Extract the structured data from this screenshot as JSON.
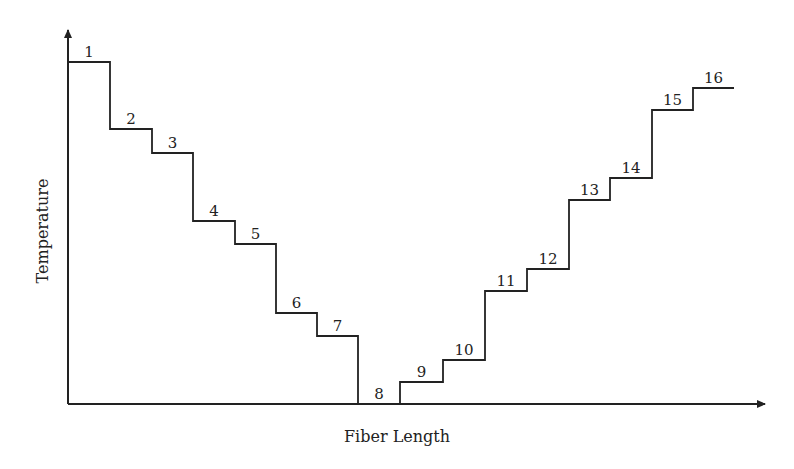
{
  "chart_data": {
    "type": "line",
    "style": "step",
    "title": "",
    "xlabel": "Fiber Length",
    "ylabel": "Temperature",
    "grid": false,
    "legend": null,
    "axis_ticks": false,
    "units_note": "Relative levels (no numeric ticks shown); values in arbitrary units, baseline = 0",
    "segments": [
      {
        "label": "1",
        "x_start": 0,
        "x_end": 42,
        "value": 342
      },
      {
        "label": "2",
        "x_start": 42,
        "x_end": 84,
        "value": 275
      },
      {
        "label": "3",
        "x_start": 84,
        "x_end": 125,
        "value": 251
      },
      {
        "label": "4",
        "x_start": 125,
        "x_end": 167,
        "value": 183
      },
      {
        "label": "5",
        "x_start": 167,
        "x_end": 208,
        "value": 160
      },
      {
        "label": "6",
        "x_start": 208,
        "x_end": 249,
        "value": 91
      },
      {
        "label": "7",
        "x_start": 249,
        "x_end": 290,
        "value": 68
      },
      {
        "label": "8",
        "x_start": 290,
        "x_end": 332,
        "value": 0
      },
      {
        "label": "9",
        "x_start": 332,
        "x_end": 375,
        "value": 22
      },
      {
        "label": "10",
        "x_start": 375,
        "x_end": 417,
        "value": 44
      },
      {
        "label": "11",
        "x_start": 417,
        "x_end": 459,
        "value": 113
      },
      {
        "label": "12",
        "x_start": 459,
        "x_end": 501,
        "value": 135
      },
      {
        "label": "13",
        "x_start": 501,
        "x_end": 542,
        "value": 204
      },
      {
        "label": "14",
        "x_start": 542,
        "x_end": 584,
        "value": 226
      },
      {
        "label": "15",
        "x_start": 584,
        "x_end": 625,
        "value": 294
      },
      {
        "label": "16",
        "x_start": 625,
        "x_end": 666,
        "value": 316
      }
    ],
    "categories": [
      "1",
      "2",
      "3",
      "4",
      "5",
      "6",
      "7",
      "8",
      "9",
      "10",
      "11",
      "12",
      "13",
      "14",
      "15",
      "16"
    ],
    "values": [
      342,
      275,
      251,
      183,
      160,
      91,
      68,
      0,
      22,
      44,
      113,
      135,
      204,
      226,
      294,
      316
    ],
    "xlim": [
      0,
      697
    ],
    "ylim": [
      0,
      374
    ]
  },
  "layout": {
    "origin_px": [
      68,
      404
    ],
    "x_axis_end_px": 765,
    "y_axis_end_px": 30,
    "line_color": "#222222"
  }
}
